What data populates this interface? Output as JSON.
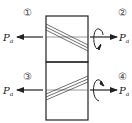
{
  "diagram": {
    "type": "helical-gear-axial-force",
    "colors": {
      "stroke": "#222222",
      "background": "#ffffff"
    },
    "gears": [
      {
        "id": "top",
        "positions": [
          {
            "marker": "①",
            "side": "left",
            "force_label": "P",
            "force_sub": "a",
            "force_direction": "left",
            "rotation": "none"
          },
          {
            "marker": "②",
            "side": "right",
            "force_label": "P",
            "force_sub": "a",
            "force_direction": "right",
            "rotation": "arrow-down-front"
          }
        ],
        "helix_slope": "descending-right"
      },
      {
        "id": "bottom",
        "positions": [
          {
            "marker": "③",
            "side": "left",
            "force_label": "P",
            "force_sub": "a",
            "force_direction": "left",
            "rotation": "none"
          },
          {
            "marker": "④",
            "side": "right",
            "force_label": "P",
            "force_sub": "a",
            "force_direction": "right",
            "rotation": "arrow-up-front"
          }
        ],
        "helix_slope": "ascending-right"
      }
    ],
    "labels": {
      "m1": "①",
      "m2": "②",
      "m3": "③",
      "m4": "④",
      "pa_main": "P",
      "pa_sub": "a"
    }
  }
}
